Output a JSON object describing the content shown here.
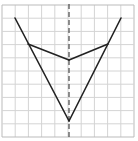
{
  "diagram": {
    "grid": {
      "cols": 10,
      "rows": 10,
      "origin_x": 2,
      "origin_y": 5,
      "cell": 13.2,
      "line_color": "#d4d4d4",
      "border_color": "#bbbbbb"
    },
    "axis": {
      "x": 69,
      "y1": 4,
      "y2": 139,
      "color": "#555555",
      "dash": "5,3"
    },
    "stroke_color": "#222222",
    "segments": [
      {
        "x1": 15,
        "y1": 18,
        "x2": 69,
        "y2": 121
      },
      {
        "x1": 121,
        "y1": 18,
        "x2": 69,
        "y2": 121
      },
      {
        "x1": 28,
        "y1": 44,
        "x2": 69,
        "y2": 60
      },
      {
        "x1": 108,
        "y1": 44,
        "x2": 69,
        "y2": 60
      }
    ]
  }
}
